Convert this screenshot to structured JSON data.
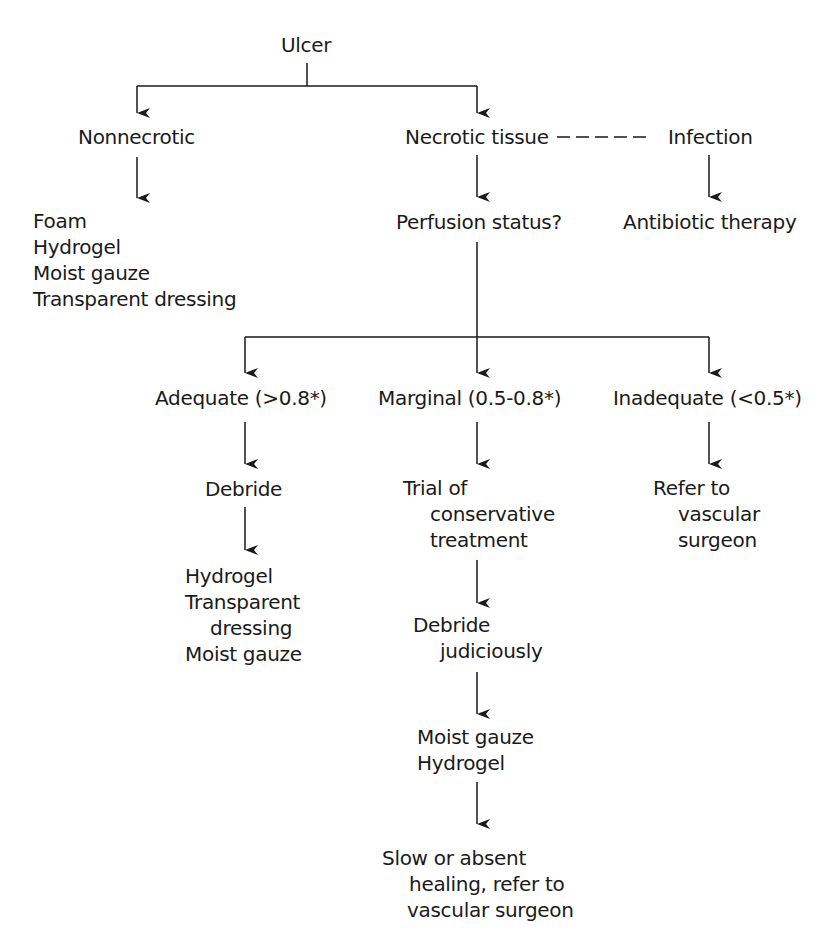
{
  "flowchart": {
    "root": {
      "label": "Ulcer"
    },
    "nonnecrotic": {
      "label": "Nonnecrotic",
      "treatments": [
        "Foam",
        "Hydrogel",
        "Moist gauze",
        "Transparent dressing"
      ]
    },
    "necrotic": {
      "label": "Necrotic tissue",
      "next": "Perfusion status?"
    },
    "infection": {
      "label": "Infection",
      "next": "Antibiotic therapy"
    },
    "perfusion": {
      "adequate": {
        "label": "Adequate (>0.8*)",
        "step": "Debride",
        "treatments": [
          "Hydrogel",
          "Transparent",
          "dressing",
          "Moist gauze"
        ]
      },
      "marginal": {
        "label": "Marginal (0.5-0.8*)",
        "step1": [
          "Trial of",
          "conservative",
          "treatment"
        ],
        "step2": [
          "Debride",
          "judiciously"
        ],
        "treatments": [
          "Moist gauze",
          "Hydrogel"
        ],
        "outcome": [
          "Slow or absent",
          "healing, refer to",
          "vascular surgeon"
        ]
      },
      "inadequate": {
        "label": "Inadequate (<0.5*)",
        "step": [
          "Refer to",
          "vascular",
          "surgeon"
        ]
      }
    },
    "colors": {
      "ink": "#1a1a1a",
      "background": "#ffffff"
    }
  }
}
